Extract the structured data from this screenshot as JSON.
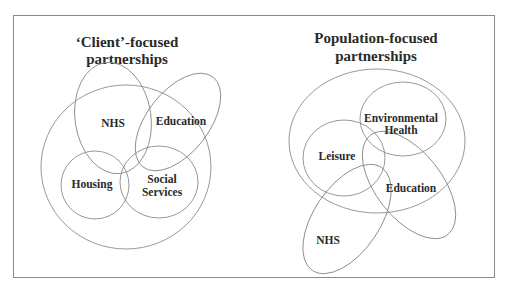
{
  "figure": {
    "panels": [
      {
        "title_line1": "‘Client’-focused",
        "title_line2": "partnerships",
        "labels": {
          "nhs": "NHS",
          "education": "Education",
          "housing": "Housing",
          "social_line1": "Social",
          "social_line2": "Services"
        }
      },
      {
        "title_line1": "Population-focused",
        "title_line2": "partnerships",
        "labels": {
          "env_line1": "Environmental",
          "env_line2": "Health",
          "leisure": "Leisure",
          "education": "Education",
          "nhs": "NHS"
        }
      }
    ],
    "colors": {
      "outline": "#8c8c8c",
      "text": "#2a2a2a",
      "frame": "#8a8a8a"
    }
  }
}
